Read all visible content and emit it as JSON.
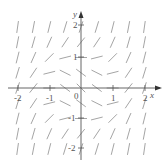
{
  "diagram": {
    "type": "slope-field",
    "equation": "y' = x^2 + y^2 - 1",
    "axes": {
      "x_label": "x",
      "y_label": "y",
      "origin_label": "0",
      "x_ticks": [
        "-2",
        "-1",
        "1",
        "2"
      ],
      "y_ticks": [
        "2",
        "1",
        "-1",
        "-2"
      ],
      "range": [
        -2,
        2
      ],
      "grid_step": 0.5
    },
    "colors": {
      "axis": "#555555",
      "segment": "#9a9a9a",
      "background": "#ffffff"
    }
  }
}
